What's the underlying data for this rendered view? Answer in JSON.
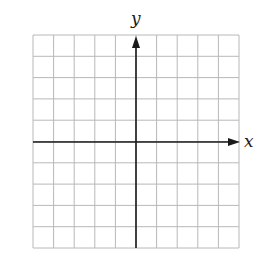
{
  "diagram": {
    "type": "coordinate-plane",
    "grid": {
      "columns": 10,
      "rows": 10,
      "left": 33,
      "top": 35,
      "width": 206,
      "height": 213,
      "line_color": "#b8b8b8"
    },
    "axes": {
      "color": "#1a1a1a",
      "x_axis": {
        "label": "x",
        "y": 142,
        "x_start": 33,
        "x_end": 240
      },
      "y_axis": {
        "label": "y",
        "x": 136,
        "y_start": 248,
        "y_end": 36
      }
    }
  }
}
